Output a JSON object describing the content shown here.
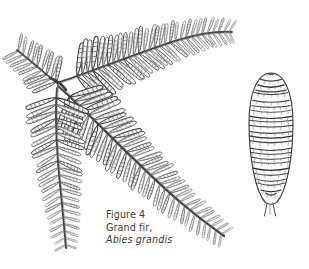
{
  "figure": {
    "caption": {
      "line1": "Figure 4",
      "line2": "Grand fir,",
      "line3": "Abies grandis"
    },
    "medium": "line engraving / hatched pen drawing",
    "background_color": "#ffffff",
    "ink_color": "#5a5a5a",
    "ink_dark": "#2e2e2e"
  },
  "illustration": {
    "branch": {
      "name": "grand-fir-branch",
      "junction": {
        "x": 58,
        "y": 84
      },
      "needle_arrangement": "two-ranked, flat, blunt-tipped",
      "stems": [
        {
          "name": "upper-left-stub",
          "tip_x": 16,
          "tip_y": 50,
          "needle_pairs": 9,
          "length": 52
        },
        {
          "name": "upper-right-arc",
          "tip_x": 232,
          "tip_y": 32,
          "needle_pairs": 30,
          "length": 190
        },
        {
          "name": "lower-left",
          "tip_x": 66,
          "tip_y": 248,
          "needle_pairs": 22,
          "length": 168
        },
        {
          "name": "main-lower-right",
          "tip_x": 224,
          "tip_y": 236,
          "needle_pairs": 32,
          "length": 212
        }
      ]
    },
    "cone": {
      "name": "grand-fir-cone",
      "center_x": 271,
      "center_y": 139,
      "width": 44,
      "height": 132,
      "shape": "elongated cylindrical, rounded apex, tapered base",
      "scale_rows": 26,
      "stalk": true
    }
  }
}
